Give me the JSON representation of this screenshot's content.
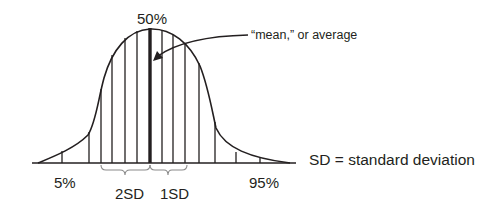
{
  "diagram": {
    "labels": {
      "peak": "50%",
      "mean_note": "“mean,” or average",
      "left_tail": "5%",
      "right_tail": "95%",
      "two_sd": "2SD",
      "one_sd": "1SD",
      "legend": "SD = standard deviation"
    },
    "colors": {
      "ink": "#231f20",
      "brace": "#8a8a8a",
      "background": "#ffffff"
    }
  }
}
